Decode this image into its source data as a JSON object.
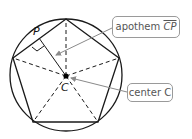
{
  "diagram": {
    "points": {
      "center_label": "C",
      "apothem_foot_label": "P"
    },
    "callouts": {
      "apothem": {
        "prefix": "apothem ",
        "segment": "CP"
      },
      "center": {
        "text": "center C"
      }
    },
    "colors": {
      "stroke": "#1a1a1a",
      "callout_border": "#9a9a9a",
      "callout_text": "#555555",
      "arrow": "#8a8a8a"
    }
  }
}
